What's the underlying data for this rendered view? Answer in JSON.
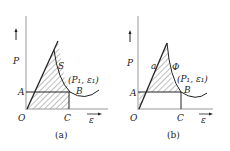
{
  "panels": [
    {
      "caption": "(a)",
      "labels": {
        "P": "P",
        "eps": "ε",
        "O": "O",
        "A": "A",
        "B": "B",
        "C": "C",
        "S": "S",
        "point": "(P₁, ε₁)"
      }
    },
    {
      "caption": "(b)",
      "labels": {
        "P": "P",
        "eps": "ε",
        "O": "O",
        "A": "A",
        "B": "B",
        "C": "C",
        "a": "a",
        "Phi": "Φ",
        "point": "(P₁, ε₁)"
      }
    }
  ],
  "colors": {
    "line": "#222222",
    "axis": "#888888",
    "hatch": "#444444"
  }
}
